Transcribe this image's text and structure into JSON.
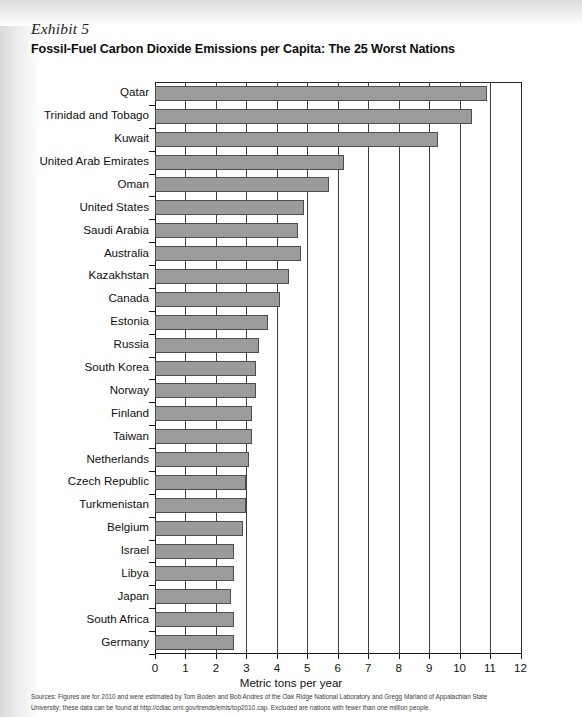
{
  "exhibit": {
    "label": "Exhibit 5",
    "title": "Fossil-Fuel Carbon Dioxide Emissions per Capita: The 25 Worst Nations"
  },
  "sources": {
    "line1": "Sources: Figures are for 2010 and were estimated by Tom Boden and Bob Andres of the Oak Ridge National Laboratory and Gregg Marland of Appalachian State",
    "line2": "University; these data can be found at http://cdiac.ornl.gov/trends/emis/top2010.cap. Excluded are nations with fewer than one million people."
  },
  "chart_data": {
    "type": "bar",
    "orientation": "horizontal",
    "title": "Fossil-Fuel Carbon Dioxide Emissions per Capita: The 25 Worst Nations",
    "xlabel": "Metric tons per year",
    "ylabel": "",
    "xlim": [
      0,
      12
    ],
    "xticks": [
      0,
      1,
      2,
      3,
      4,
      5,
      6,
      7,
      8,
      9,
      10,
      11,
      12
    ],
    "xtick_labels": [
      "0",
      "1",
      "2",
      "3",
      "4",
      "5",
      "6",
      "7",
      "8",
      "9",
      "10",
      "11",
      "12"
    ],
    "grid": "vertical",
    "legend": "none",
    "bar_color": "#9b9b9b",
    "bar_edge_color": "#4d4d4d",
    "categories": [
      "Qatar",
      "Trinidad and Tobago",
      "Kuwait",
      "United Arab Emirates",
      "Oman",
      "United States",
      "Saudi Arabia",
      "Australia",
      "Kazakhstan",
      "Canada",
      "Estonia",
      "Russia",
      "South Korea",
      "Norway",
      "Finland",
      "Taiwan",
      "Netherlands",
      "Czech Republic",
      "Turkmenistan",
      "Belgium",
      "Israel",
      "Libya",
      "Japan",
      "South Africa",
      "Germany"
    ],
    "values": [
      10.9,
      10.4,
      9.3,
      6.2,
      5.7,
      4.9,
      4.7,
      4.8,
      4.4,
      4.1,
      3.7,
      3.4,
      3.3,
      3.3,
      3.2,
      3.2,
      3.1,
      3.0,
      3.0,
      2.9,
      2.6,
      2.6,
      2.5,
      2.6,
      2.6
    ]
  }
}
